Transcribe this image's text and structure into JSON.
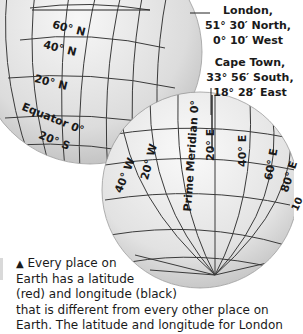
{
  "london_globe": {
    "latitude_labels": [
      "60° N",
      "40° N",
      "20° N",
      "Equator 0°",
      "20° S"
    ],
    "callout": {
      "city": "London,",
      "latitude": "51° 30′ North,",
      "longitude": "0° 10′ West"
    }
  },
  "capetown_globe": {
    "longitude_labels": [
      "40° W",
      "20° W",
      "Prime Meridian 0°",
      "20° E",
      "40° E",
      "60° E",
      "80° E",
      "10"
    ],
    "callout": {
      "city": "Cape Town,",
      "latitude": "33° 56′ South,",
      "longitude": "18° 28′ East"
    }
  },
  "caption": {
    "icon": "▲",
    "lines": [
      "Every place on",
      "Earth has a latitude",
      "(red) and longitude (black)",
      "that is different from every other place on",
      "Earth. The latitude and longitude for London"
    ]
  },
  "colors": {
    "grid_line": "#3a3a3a",
    "globe_fill": "#e6e6e6",
    "text": "#1a1a1a"
  }
}
